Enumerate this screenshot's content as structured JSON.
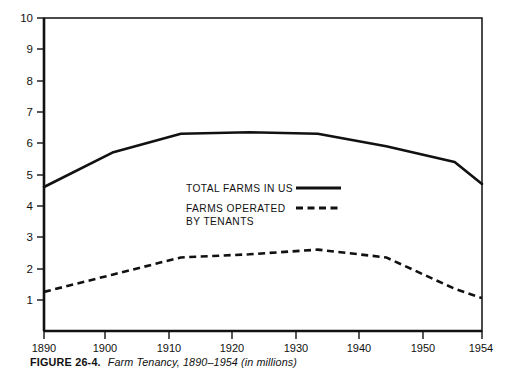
{
  "caption": {
    "figure_number": "FIGURE 26-4.",
    "title": "Farm Tenancy, 1890–1954 (in millions)"
  },
  "legend": {
    "entries": [
      {
        "label_line1": "TOTAL FARMS IN US",
        "label_line2": "",
        "style": "solid"
      },
      {
        "label_line1": "FARMS OPERATED",
        "label_line2": "BY TENANTS",
        "style": "dashed"
      }
    ]
  },
  "axes": {
    "y_ticks": [
      "10",
      "9",
      "8",
      "7",
      "6",
      "5",
      "4",
      "3",
      "2",
      "1"
    ],
    "x_ticks": [
      "1890",
      "1900",
      "1910",
      "1920",
      "1930",
      "1940",
      "1950",
      "1954"
    ]
  },
  "colors": {
    "ink": "#111111",
    "background": "#ffffff"
  },
  "chart_data": {
    "type": "line",
    "title": "Farm Tenancy, 1890–1954 (in millions)",
    "xlabel": "",
    "ylabel": "",
    "ylim": [
      0,
      10
    ],
    "grid": false,
    "legend_position": "inside-center",
    "x": [
      1890,
      1900,
      1910,
      1920,
      1930,
      1940,
      1950,
      1954
    ],
    "xtick_labels": [
      "1890",
      "1900",
      "1910",
      "1920",
      "1930",
      "1940",
      "1950",
      "1954"
    ],
    "ytick_labels": [
      "1",
      "2",
      "3",
      "4",
      "5",
      "6",
      "7",
      "8",
      "9",
      "10"
    ],
    "series": [
      {
        "name": "TOTAL FARMS IN US",
        "style": "solid",
        "values": [
          4.6,
          5.7,
          6.3,
          6.35,
          6.3,
          5.9,
          5.4,
          4.7
        ]
      },
      {
        "name": "FARMS OPERATED BY TENANTS",
        "style": "dashed",
        "values": [
          1.25,
          1.8,
          2.35,
          2.45,
          2.6,
          2.35,
          1.35,
          1.05
        ]
      }
    ]
  }
}
